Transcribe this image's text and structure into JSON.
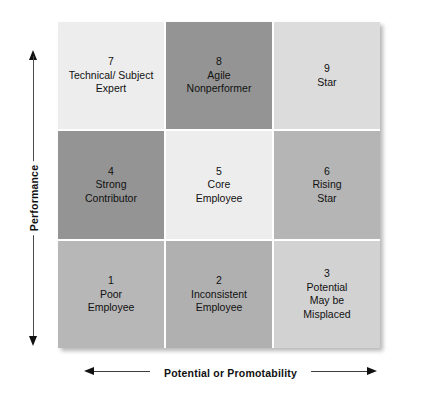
{
  "diagram": {
    "type": "nine-box-grid",
    "title_visible": false
  },
  "axes": {
    "y": {
      "label": "Performance",
      "arrow_top": "arrow-up-icon",
      "arrow_bottom": "arrow-down-icon"
    },
    "x": {
      "label": "Potential or Promotability",
      "arrow_left": "arrow-left-icon",
      "arrow_right": "arrow-right-icon"
    }
  },
  "colors": {
    "very_light": "#ededed",
    "light": "#d8d8d8",
    "medium_light": "#c6c6c6",
    "medium": "#b7b7b7",
    "dark": "#949494",
    "background": "#ffffff",
    "text": "#111111"
  },
  "grid": {
    "rows": 3,
    "columns": 3,
    "cells": [
      {
        "number": "7",
        "lines": [
          "Technical/ Subject",
          "Expert"
        ],
        "fill": "#ededed",
        "row": 1,
        "col": 1
      },
      {
        "number": "8",
        "lines": [
          "Agile",
          "Nonperformer"
        ],
        "fill": "#949494",
        "row": 1,
        "col": 2
      },
      {
        "number": "9",
        "lines": [
          "Star"
        ],
        "fill": "#dcdcdc",
        "row": 1,
        "col": 3
      },
      {
        "number": "4",
        "lines": [
          "Strong",
          "Contributor"
        ],
        "fill": "#949494",
        "row": 2,
        "col": 1
      },
      {
        "number": "5",
        "lines": [
          "Core",
          "Employee"
        ],
        "fill": "#ededed",
        "row": 2,
        "col": 2
      },
      {
        "number": "6",
        "lines": [
          "Rising",
          "Star"
        ],
        "fill": "#b5b5b5",
        "row": 2,
        "col": 3
      },
      {
        "number": "1",
        "lines": [
          "Poor",
          "Employee"
        ],
        "fill": "#b7b7b7",
        "row": 3,
        "col": 1
      },
      {
        "number": "2",
        "lines": [
          "Inconsistent",
          "Employee"
        ],
        "fill": "#b0b0b0",
        "row": 3,
        "col": 2
      },
      {
        "number": "3",
        "lines": [
          "Potential",
          "May be",
          "Misplaced"
        ],
        "fill": "#d2d2d2",
        "row": 3,
        "col": 3
      }
    ]
  }
}
